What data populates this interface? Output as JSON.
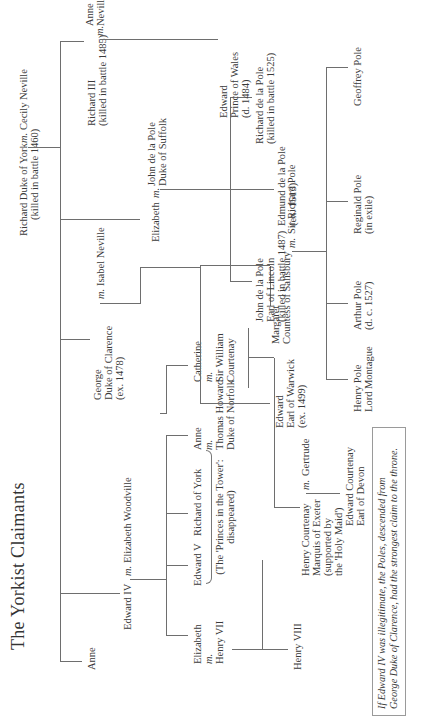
{
  "title": "The Yorkist Claimants",
  "marriage_marker": "m.",
  "people": {
    "richard_york": [
      "Richard Duke of York",
      "(killed in battle 1460)"
    ],
    "cecily": "Cecily Neville",
    "anne_elder": "Anne",
    "edward_iv": "Edward IV",
    "elizabeth_woodville": "Elizabeth Woodville",
    "george": [
      "George",
      "Duke of Clarence",
      "(ex. 1478)"
    ],
    "isabel": "Isabel Neville",
    "elizabeth_york_sister": "Elizabeth",
    "john_suffolk": [
      "John de la Pole",
      "Duke of Suffolk"
    ],
    "richard_iii": [
      "Richard III",
      "(killed in battle 1485)"
    ],
    "anne_neville": [
      "Anne",
      "Neville"
    ],
    "elizabeth_henry": [
      "Elizabeth",
      "m.",
      "Henry VII"
    ],
    "edward_v": "Edward V",
    "richard_of_york": "Richard of York",
    "princes_note": [
      "(The 'Princes in the Tower':",
      "disappeared)"
    ],
    "anne_howard": [
      "Anne",
      "m.",
      "Thomas Howard",
      "Duke of Norfolk"
    ],
    "catherine": [
      "Catherine",
      "m.",
      "Sir William",
      "Courtenay"
    ],
    "edward_warwick": [
      "Edward",
      "Earl of Warwick",
      "(ex. 1499)"
    ],
    "margaret": [
      "Margaret",
      "Countess of Salisbury"
    ],
    "sir_richard_pole": "Sir Richard Pole",
    "john_lincoln": [
      "John de la Pole",
      "Earl of Lincoln",
      "(killed in battle 1487)"
    ],
    "edmund": [
      "Edmund de la Pole",
      "(ex. 1513)"
    ],
    "richard_dlp": [
      "Richard de la Pole",
      "(killed in battle 1525)"
    ],
    "edward_wales": [
      "Edward",
      "Prince of Wales",
      "(d. 1484)"
    ],
    "henry_viii": "Henry VIII",
    "henry_courtenay": [
      "Henry Courtenay",
      "Marquis of Exeter",
      "(supported by",
      "the 'Holy Maid')"
    ],
    "gertrude": "Gertrude",
    "edward_devon": [
      "Edward Courtenay",
      "Earl of Devon"
    ],
    "henry_pole": [
      "Henry Pole",
      "Lord Montague"
    ],
    "arthur_pole": [
      "Arthur Pole",
      "(d. c. 1527)"
    ],
    "reginald_pole": [
      "Reginald Pole",
      "(in exile)"
    ],
    "geoffrey_pole": "Geoffrey Pole"
  },
  "footnote": [
    "If Edward IV was illegitimate, the Poles, descended from",
    "George Duke of Clarence, had the strongest claim to the throne."
  ]
}
